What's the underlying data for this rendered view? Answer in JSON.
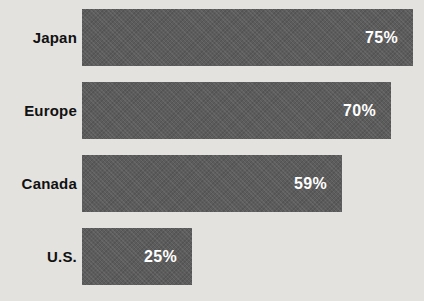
{
  "chart_data": {
    "type": "bar",
    "orientation": "horizontal",
    "title": "",
    "xlabel": "",
    "ylabel": "",
    "categories": [
      "Japan",
      "Europe",
      "Canada",
      "U.S."
    ],
    "values": [
      75,
      70,
      59,
      25
    ],
    "value_labels": [
      "75%",
      "70%",
      "59%",
      "25%"
    ],
    "xlim": [
      0,
      100
    ],
    "grid": false,
    "legend": false,
    "colors": {
      "bar": "#5c5c5c",
      "background": "#e3e2df",
      "category_label": "#111111",
      "value_label": "#ffffff"
    }
  }
}
